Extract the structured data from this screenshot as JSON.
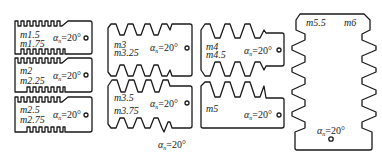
{
  "diagram": {
    "type": "gear-tooth-module-gauge-set",
    "caption": {
      "symbol": "α",
      "subscript": "n",
      "value": "=20°"
    },
    "colors": {
      "line": "#1a1a1a",
      "background": "#ffffff"
    },
    "gauges": [
      {
        "id": "g1",
        "modules": [
          "m1.5",
          "m1.75"
        ],
        "angle": {
          "symbol": "α",
          "subscript": "n",
          "value": "=20°"
        }
      },
      {
        "id": "g2",
        "modules": [
          "m2",
          "m2.25"
        ],
        "angle": {
          "symbol": "α",
          "subscript": "n",
          "value": "=20°"
        }
      },
      {
        "id": "g3",
        "modules": [
          "m2.5",
          "m2.75"
        ],
        "angle": {
          "symbol": "α",
          "subscript": "n",
          "value": "=20°"
        }
      },
      {
        "id": "g4",
        "modules": [
          "m3",
          "m3.25"
        ],
        "angle": {
          "symbol": "α",
          "subscript": "n",
          "value": "=20°"
        }
      },
      {
        "id": "g5",
        "modules": [
          "m3.5",
          "m3.75"
        ],
        "angle": {
          "symbol": "α",
          "subscript": "n",
          "value": "=20°"
        }
      },
      {
        "id": "g6",
        "modules": [
          "m4",
          "m4.5"
        ],
        "angle": {
          "symbol": "α",
          "subscript": "n",
          "value": "=20°"
        }
      },
      {
        "id": "g7",
        "modules": [
          "m5"
        ],
        "angle": {
          "symbol": "α",
          "subscript": "n",
          "value": "=20°"
        }
      },
      {
        "id": "g8",
        "modules": [
          "m5.5",
          "m6"
        ],
        "angle": {
          "symbol": "α",
          "subscript": "n",
          "value": "=20°"
        }
      }
    ]
  }
}
